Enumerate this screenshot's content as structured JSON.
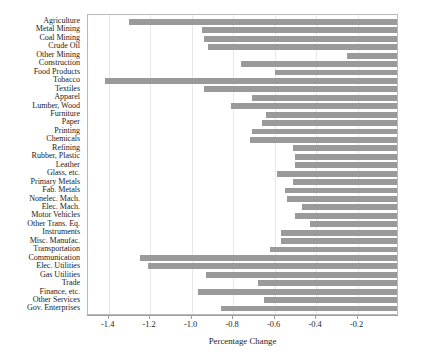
{
  "chart_data": {
    "type": "bar",
    "orientation": "horizontal",
    "title": "",
    "xlabel": "Percentage Change",
    "ylabel": "",
    "xlim": [
      -1.5,
      0.0
    ],
    "xticks": [
      -1.4,
      -1.2,
      -1.0,
      -0.8,
      -0.6,
      -0.4,
      -0.2
    ],
    "xticklabels": [
      "-1.4",
      "-1.2",
      "-1.0",
      "-0.8",
      "-0.6",
      "-0.4",
      "-0.2"
    ],
    "grid": true,
    "legend": null,
    "bar_color": "#9a9a9a",
    "categories": [
      "Agriculture",
      "Metal Mining",
      "Coal Mining",
      "Crude Oil",
      "Other Mining",
      "Construction",
      "Food Products",
      "Tobacco",
      "Textiles",
      "Apparel",
      "Lumber, Wood",
      "Furniture",
      "Paper",
      "Printing",
      "Chemicals",
      "Refining",
      "Rubber, Plastic",
      "Leather",
      "Glass, etc.",
      "Primary Metals",
      "Fab. Metals",
      "Nonelec. Mach.",
      "Elec. Mach.",
      "Motor Vehicles",
      "Other Trans. Eq.",
      "Instruments",
      "Misc. Manufac.",
      "Transportation",
      "Communication",
      "Elec. Utilities",
      "Gas Utilities",
      "Trade",
      "Finance, etc.",
      "Other Services",
      "Gov. Enterprises"
    ],
    "values": [
      -1.3,
      -0.95,
      -0.94,
      -0.92,
      -0.25,
      -0.76,
      -0.6,
      -1.42,
      -0.94,
      -0.71,
      -0.81,
      -0.64,
      -0.66,
      -0.71,
      -0.72,
      -0.51,
      -0.5,
      -0.5,
      -0.59,
      -0.51,
      -0.55,
      -0.54,
      -0.47,
      -0.5,
      -0.43,
      -0.57,
      -0.57,
      -0.62,
      -1.25,
      -1.21,
      -0.93,
      -0.68,
      -0.97,
      -0.65,
      -0.86
    ]
  }
}
